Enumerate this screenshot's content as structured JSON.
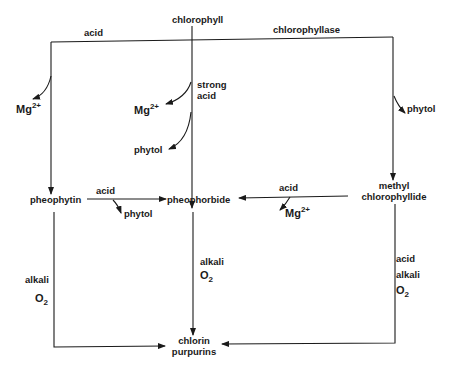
{
  "diagram": {
    "type": "reaction-pathway",
    "nodes": {
      "chlorophyll": "chlorophyll",
      "pheophytin": "pheophytin",
      "pheophorbide": "pheophorbide",
      "methyl_chlorophyllide_line1": "methyl",
      "methyl_chlorophyllide_line2": "chlorophyllide",
      "chlorin_line1": "chlorin",
      "chlorin_line2": "purpurins"
    },
    "edge_labels": {
      "top_left_acid": "acid",
      "top_right_chlorophyllase": "chlorophyllase",
      "left_mg_base": "Mg",
      "left_mg_charge": "2+",
      "center_strong": "strong",
      "center_acid": "acid",
      "center_mg_base": "Mg",
      "center_mg_charge": "2+",
      "center_phytol": "phytol",
      "right_phytol": "phytol",
      "pheophytin_acid": "acid",
      "pheophytin_phytol": "phytol",
      "methyl_acid": "acid",
      "methyl_mg_base": "Mg",
      "methyl_mg_charge": "2+",
      "left_alkali": "alkali",
      "left_o_base": "O",
      "left_o_sub": "2",
      "center_alkali": "alkali",
      "center_o_base": "O",
      "center_o_sub": "2",
      "right_acid": "acid",
      "right_alkali": "alkali",
      "right_o_base": "O",
      "right_o_sub": "2"
    },
    "edges": [
      {
        "from": "chlorophyll",
        "to": "pheophytin",
        "conditions": [
          "acid"
        ],
        "byproducts": [
          "Mg2+"
        ]
      },
      {
        "from": "chlorophyll",
        "to": "pheophorbide",
        "conditions": [
          "strong acid"
        ],
        "byproducts": [
          "Mg2+",
          "phytol"
        ]
      },
      {
        "from": "chlorophyll",
        "to": "methyl chlorophyllide",
        "conditions": [
          "chlorophyllase"
        ],
        "byproducts": [
          "phytol"
        ]
      },
      {
        "from": "pheophytin",
        "to": "pheophorbide",
        "conditions": [
          "acid"
        ],
        "byproducts": [
          "phytol"
        ]
      },
      {
        "from": "methyl chlorophyllide",
        "to": "pheophorbide",
        "conditions": [
          "acid"
        ],
        "byproducts": [
          "Mg2+"
        ]
      },
      {
        "from": "pheophytin",
        "to": "chlorin purpurins",
        "conditions": [
          "alkali",
          "O2"
        ]
      },
      {
        "from": "pheophorbide",
        "to": "chlorin purpurins",
        "conditions": [
          "alkali",
          "O2"
        ]
      },
      {
        "from": "methyl chlorophyllide",
        "to": "chlorin purpurins",
        "conditions": [
          "acid",
          "alkali",
          "O2"
        ]
      }
    ]
  }
}
